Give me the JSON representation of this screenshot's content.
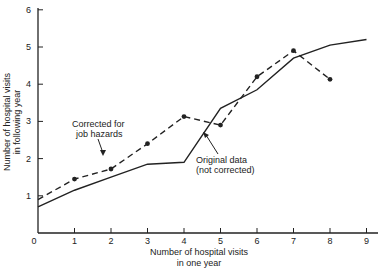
{
  "chart_data": {
    "type": "line",
    "title": "",
    "xlabel": "Number of hospital visits in one year",
    "xlabel_lines": [
      "Number of hospital visits",
      "in one year"
    ],
    "ylabel": "Number of hospital visits in following year",
    "ylabel_lines": [
      "Number of hospital visits",
      "in following year"
    ],
    "xlim": [
      0,
      9
    ],
    "ylim": [
      0,
      6
    ],
    "x_ticks": [
      "0",
      "1",
      "2",
      "3",
      "4",
      "5",
      "6",
      "7",
      "8",
      "9"
    ],
    "y_ticks": [
      "1",
      "2",
      "3",
      "4",
      "5",
      "6"
    ],
    "grid": false,
    "legend": "none (inline annotations)",
    "series": [
      {
        "name": "Corrected for job hazards",
        "style": "dashed with markers",
        "x": [
          0,
          1,
          2,
          3,
          4,
          5,
          6,
          7,
          8
        ],
        "values": [
          0.9,
          1.45,
          1.72,
          2.4,
          3.13,
          2.9,
          4.2,
          4.9,
          4.13
        ]
      },
      {
        "name": "Original data (not corrected)",
        "style": "solid",
        "x": [
          0,
          1,
          2,
          3,
          4,
          5,
          6,
          7,
          8,
          9
        ],
        "values": [
          0.7,
          1.15,
          1.5,
          1.85,
          1.9,
          3.35,
          3.85,
          4.7,
          5.05,
          5.2
        ]
      }
    ],
    "annotations": [
      {
        "lines": [
          "Corrected for",
          "job hazards"
        ],
        "points_to": "dashed series near x=2.6"
      },
      {
        "lines": [
          "Original data",
          "(not corrected)"
        ],
        "points_to": "solid series near x=4.6"
      }
    ]
  }
}
